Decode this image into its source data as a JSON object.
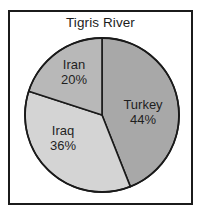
{
  "chart_data": {
    "type": "pie",
    "title": "Tigris River",
    "xlabel": "",
    "ylabel": "",
    "categories": [
      "Turkey",
      "Iraq",
      "Iran"
    ],
    "values": [
      44,
      36,
      20
    ],
    "value_unit": "%",
    "labels": [
      "44%",
      "36%",
      "20%"
    ],
    "colors": [
      "#a8a8a8",
      "#d4d4d4",
      "#b8b8b8"
    ],
    "start_angle_deg": 0,
    "direction": "clockwise",
    "legend": "none",
    "grid": false,
    "slices": [
      {
        "name": "Turkey",
        "value": 44,
        "label": "44%",
        "color": "#a8a8a8"
      },
      {
        "name": "Iraq",
        "value": 36,
        "label": "36%",
        "color": "#d4d4d4"
      },
      {
        "name": "Iran",
        "value": 20,
        "label": "20%",
        "color": "#b8b8b8"
      }
    ]
  },
  "figure": {
    "title": "Tigris River",
    "border_color": "#1b1b1b",
    "background": "#ffffff",
    "outline_color": "#1a1a1a"
  }
}
